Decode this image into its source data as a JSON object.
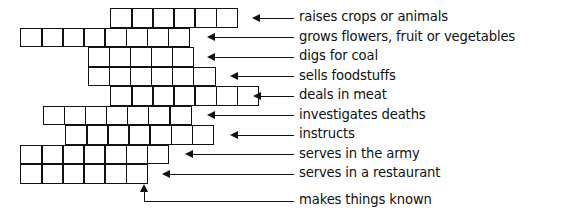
{
  "puzzle": {
    "title": "occupations crossword grid with clues",
    "ink_color": "#111111",
    "background_color": "#ffffff",
    "grid": {
      "cell_width": 22.5,
      "cell_height": 19.5,
      "origin_x": 20,
      "origin_y": 8,
      "rows": [
        {
          "index": 1,
          "start_col": 4,
          "cells": 6
        },
        {
          "index": 2,
          "start_col": 0,
          "cells": 8
        },
        {
          "index": 3,
          "start_col": 3,
          "cells": 5
        },
        {
          "index": 4,
          "start_col": 3,
          "cells": 6
        },
        {
          "index": 5,
          "start_col": 4,
          "cells": 7
        },
        {
          "index": 6,
          "start_col": 1,
          "cells": 7
        },
        {
          "index": 7,
          "start_col": 2,
          "cells": 7
        },
        {
          "index": 8,
          "start_col": 0,
          "cells": 7
        },
        {
          "index": 9,
          "start_col": 0,
          "cells": 6
        }
      ]
    },
    "clues": [
      {
        "index": 1,
        "label": "raises crops or animals"
      },
      {
        "index": 2,
        "label": "grows flowers, fruit or vegetables"
      },
      {
        "index": 3,
        "label": "digs for coal"
      },
      {
        "index": 4,
        "label": "sells foodstuffs"
      },
      {
        "index": 5,
        "label": "deals in meat"
      },
      {
        "index": 6,
        "label": "investigates deaths"
      },
      {
        "index": 7,
        "label": "instructs"
      },
      {
        "index": 8,
        "label": "serves in the army"
      },
      {
        "index": 9,
        "label": "serves in a restaurant"
      },
      {
        "index": 10,
        "label": "makes things known"
      }
    ]
  }
}
